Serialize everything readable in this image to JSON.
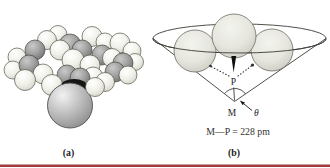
{
  "figure": {
    "panel_a": {
      "caption": "(a)",
      "description": "space-filling molecular model of phosphine ligand on metal atom"
    },
    "panel_b": {
      "caption": "(b)",
      "p_label": "P",
      "m_label": "M",
      "theta_label": "θ",
      "bond_length": "M—P = 228 pm",
      "description": "cone-angle diagram: three substituent spheres in cone, apex at metal M, angle θ"
    },
    "colors": {
      "background": "#ffffff",
      "hydrogen_sphere": "#f3f3ec",
      "carbon_sphere": "#9b9b9b",
      "metal_sphere": "#b5b5b5",
      "cone_sphere": "#e6e6df",
      "line": "#3c3c38",
      "text": "#23231f",
      "bottom_rule": "#a13a3c"
    }
  }
}
